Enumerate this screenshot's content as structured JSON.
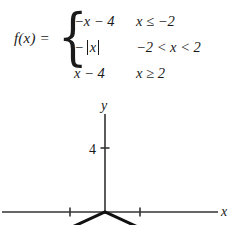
{
  "formula": {
    "function_label": "f(x) =",
    "brace_glyph": "{",
    "pieces": [
      {
        "expression_pre": "−x − 4",
        "expression_abs": "",
        "expression_post": "",
        "condition": "x ≤ −2"
      },
      {
        "expression_pre": "−",
        "expression_abs": "x",
        "expression_post": "",
        "condition": "−2 < x < 2"
      },
      {
        "expression_pre": "x − 4",
        "expression_abs": "",
        "expression_post": "",
        "condition": "x ≥ 2"
      }
    ]
  },
  "graph": {
    "y_axis_label": "y",
    "x_axis_label": "x",
    "y_tick_label": "4",
    "axis_color": "#333333",
    "curve_color": "#111111",
    "origin_px": {
      "x": 105,
      "y": 116
    },
    "x_unit_px": 35,
    "y_unit_px": 16,
    "x_ticks": [
      -1,
      1
    ],
    "y_ticks": [
      4
    ],
    "segments": [
      {
        "name": "left-branch",
        "expression": "-x-4",
        "x_from": -3.0,
        "x_to": -2.0
      },
      {
        "name": "middle-branch",
        "expression": "-|x|",
        "x_from": -2.0,
        "x_to": 2.0
      },
      {
        "name": "right-branch",
        "expression": "x-4",
        "x_from": 2.0,
        "x_to": 3.0
      }
    ]
  },
  "chart_data": {
    "type": "line",
    "title": "",
    "xlabel": "x",
    "ylabel": "y",
    "xlim": [
      -3.0,
      3.4
    ],
    "ylim": [
      -2.6,
      7.0
    ],
    "grid": false,
    "legend": "none",
    "xticks": [
      -1,
      1
    ],
    "yticks": [
      4
    ],
    "series": [
      {
        "name": "-x-4  (x ≤ -2)",
        "x": [
          -3.0,
          -2.0
        ],
        "y": [
          -1.0,
          -2.0
        ]
      },
      {
        "name": "-|x|  (-2 < x < 2)",
        "x": [
          -2.0,
          0.0,
          2.0
        ],
        "y": [
          -2.0,
          0.0,
          -2.0
        ]
      },
      {
        "name": "x-4  (x ≥ 2)",
        "x": [
          2.0,
          3.0
        ],
        "y": [
          -2.0,
          -1.0
        ]
      }
    ]
  }
}
